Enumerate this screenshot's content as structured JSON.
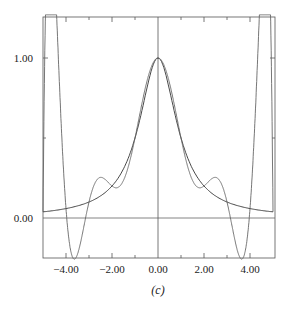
{
  "chart_data": {
    "type": "line",
    "title": "",
    "caption": "(c)",
    "xlabel": "",
    "ylabel": "",
    "xlim": [
      -5.0,
      5.0
    ],
    "ylim": [
      -0.25,
      1.25
    ],
    "x_ticks": [
      "-4.00",
      "-2.00",
      "0.00",
      "2.00",
      "4.00"
    ],
    "y_ticks": [
      "0.00",
      "1.00"
    ],
    "grid": false,
    "axis_lines": {
      "x_zero": true,
      "y_zero": true
    },
    "series": [
      {
        "name": "function 1/(1+x^2)",
        "color": "#333333",
        "x": [
          -5,
          -4,
          -3,
          -2,
          -1,
          -0.5,
          0,
          0.5,
          1,
          2,
          3,
          4,
          5
        ],
        "y": [
          0.04,
          0.06,
          0.1,
          0.2,
          0.5,
          0.8,
          1.0,
          0.8,
          0.5,
          0.2,
          0.1,
          0.06,
          0.04
        ]
      },
      {
        "name": "interpolating polynomial",
        "color": "#666666",
        "x": [
          -4.7,
          -4.5,
          -4.1,
          -3.8,
          -3.6,
          -3.3,
          -3.0,
          -2.8,
          -2.0,
          -1.0,
          0,
          1.0,
          2.0,
          2.8,
          3.0,
          3.3,
          3.6,
          3.8,
          4.1,
          4.5,
          4.7
        ],
        "y": [
          1.25,
          1.25,
          -0.25,
          -0.25,
          0.08,
          0.2,
          0.12,
          0.08,
          0.2,
          0.5,
          1.0,
          0.5,
          0.2,
          0.08,
          0.12,
          0.2,
          0.08,
          -0.25,
          -0.25,
          1.25,
          1.25
        ]
      }
    ]
  },
  "labels": {
    "x_ticks": [
      "−4.00",
      "−2.00",
      "0.00",
      "2.00",
      "4.00"
    ],
    "y_ticks": [
      "0.00",
      "1.00"
    ],
    "caption": "(c)"
  }
}
